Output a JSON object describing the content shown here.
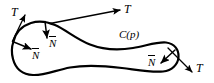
{
  "figure": {
    "name": "curve-tangent-normal-diagram",
    "background_color": "#ffffff",
    "stroke_color": "#000000",
    "width": 214,
    "height": 83
  },
  "curve": {
    "name": "C(p)",
    "label": "C(p)",
    "label_x": 119,
    "label_y": 29,
    "closed": true,
    "stroke_width": 2.2,
    "path": "M 13.5 41.5 C 15.5 33.0 22.0 26.0 31.0 23.0 C 40.0 20.0 48.5 22.2 55.0 25.0 C 66.0 29.8 76.0 39.0 90.0 44.5 C 104.0 50.0 118.0 50.5 133.0 48.0 C 146.0 45.8 158.0 41.5 166.0 42.5 C 174.5 43.6 179.0 49.5 178.5 57.0 C 178.0 64.5 172.0 70.5 163.0 71.5 C 152.0 72.7 138.0 70.0 122.0 68.0 C 104.0 65.7 86.0 64.5 70.0 67.5 C 56.0 70.1 44.5 75.5 33.0 75.0 C 22.5 74.5 15.5 68.5 13.0 59.0 C 11.2 52.2 11.8 46.2 13.5 41.5 Z"
  },
  "vectors": [
    {
      "id": "tangent-upper-left",
      "kind": "tangent",
      "label": "T",
      "label_x": 11,
      "label_y": 6,
      "arrow_from_x": 12.5,
      "arrow_from_y": 41.0,
      "arrow_to_x": 25.0,
      "arrow_to_y": 15.0
    },
    {
      "id": "tangent-upper-right",
      "kind": "tangent",
      "label": "T",
      "label_x": 124,
      "label_y": 3,
      "arrow_from_x": 50.0,
      "arrow_from_y": 23.5,
      "arrow_to_x": 120.0,
      "arrow_to_y": 10.0
    },
    {
      "id": "tangent-lower-right",
      "kind": "tangent",
      "label": "T",
      "label_x": 196,
      "label_y": 62,
      "arrow_from_x": 168.0,
      "arrow_from_y": 48.0,
      "arrow_to_x": 192.0,
      "arrow_to_y": 72.0
    },
    {
      "id": "normal-top",
      "kind": "normal",
      "label": "N",
      "label_x": 49,
      "label_y": 38,
      "arrow_from_x": 45.0,
      "arrow_from_y": 21.5,
      "arrow_to_x": 47.0,
      "arrow_to_y": 38.0
    },
    {
      "id": "normal-left",
      "kind": "normal",
      "label": "N",
      "label_x": 32,
      "label_y": 50,
      "arrow_from_x": 12.5,
      "arrow_from_y": 41.5,
      "arrow_to_x": 31.0,
      "arrow_to_y": 49.0
    },
    {
      "id": "normal-right",
      "kind": "normal",
      "label": "N",
      "label_x": 148,
      "label_y": 57,
      "arrow_from_x": 175.0,
      "arrow_from_y": 50.0,
      "arrow_to_x": 161.0,
      "arrow_to_y": 63.0
    }
  ],
  "legend": {
    "tangent_symbol": "T",
    "normal_symbol": "N",
    "normal_has_overbar": true,
    "curve_symbol": "C(p)"
  }
}
